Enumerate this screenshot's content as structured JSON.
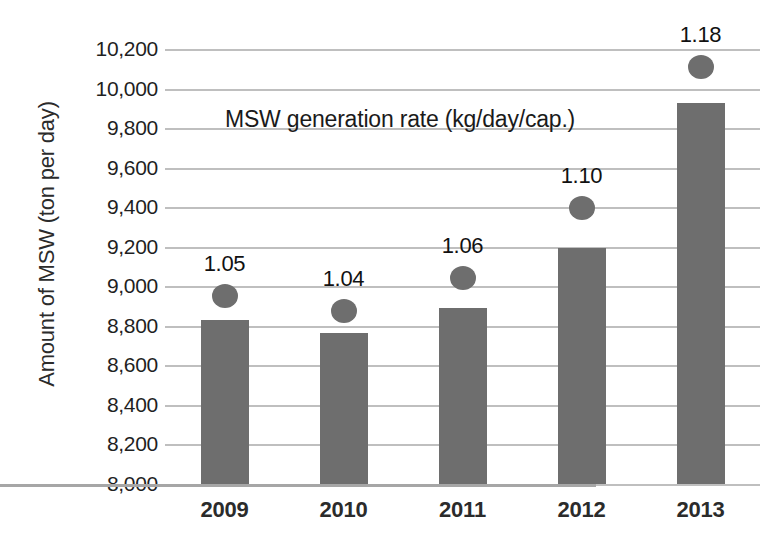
{
  "chart_data": {
    "type": "bar",
    "title": "",
    "subtitle": "",
    "categories": [
      "2009",
      "2010",
      "2011",
      "2012",
      "2013"
    ],
    "xlabel": "",
    "ylabel": "Amount of MSW (ton per day)",
    "ylim": [
      8000,
      10200
    ],
    "ytick_step": 200,
    "ytick_labels": [
      "10,200",
      "10,000",
      "9,800",
      "9,600",
      "9,400",
      "9,200",
      "9,000",
      "8,800",
      "8,600",
      "8,400",
      "8,200",
      "8,000"
    ],
    "ytick_values": [
      10200,
      10000,
      9800,
      9600,
      9400,
      9200,
      9000,
      8800,
      8600,
      8400,
      8200,
      8000
    ],
    "grid": true,
    "legend": "none",
    "annotations": [
      {
        "text": "MSW generation rate (kg/day/cap.)",
        "x_px": 225,
        "y_px": 106
      }
    ],
    "series": [
      {
        "name": "Amount of MSW (ton per day)",
        "type": "bar",
        "color": "#6e6e6e",
        "axis": "left",
        "values": [
          8830,
          8765,
          8890,
          9195,
          9925
        ]
      },
      {
        "name": "MSW generation rate (kg/day/cap.)",
        "type": "scatter",
        "color": "#6e6e6e",
        "axis": "right",
        "values": [
          1.05,
          1.04,
          1.06,
          1.1,
          1.18
        ],
        "labels": [
          "1.05",
          "1.04",
          "1.06",
          "1.10",
          "1.18"
        ],
        "marker_y_px": [
          296,
          311,
          278,
          208,
          67
        ],
        "label_y_px": [
          277,
          292,
          259,
          189,
          48
        ]
      }
    ]
  },
  "colors": {
    "series_gray": "#6e6e6e",
    "gridline": "#bfbfbf",
    "axis": "#a6a6a6",
    "text": "#1f1f1f",
    "background": "#ffffff"
  }
}
